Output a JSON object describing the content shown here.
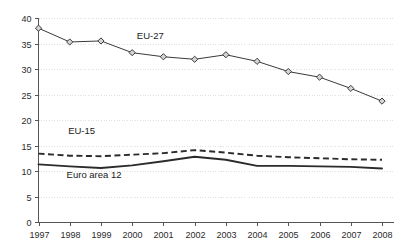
{
  "chart_data": {
    "type": "line",
    "title": "",
    "subtitle": "",
    "xlabel": "",
    "ylabel": "",
    "x": [
      1997,
      1998,
      1999,
      2000,
      2001,
      2002,
      2003,
      2004,
      2005,
      2006,
      2007,
      2008
    ],
    "categories": [
      "1997",
      "1998",
      "1999",
      "2000",
      "2001",
      "2002",
      "2003",
      "2004",
      "2005",
      "2006",
      "2007",
      "2008"
    ],
    "xlim": [
      1997,
      2008
    ],
    "ylim": [
      0,
      40
    ],
    "y_ticks": [
      0,
      5,
      10,
      15,
      20,
      25,
      30,
      35,
      40
    ],
    "y_tick_labels": [
      "0",
      "5",
      "10",
      "15",
      "20",
      "25",
      "30",
      "35",
      "40"
    ],
    "grid": true,
    "grid_axis": "y",
    "legend": "inline-annotations",
    "series": [
      {
        "name": "EU-27",
        "style": "solid-with-diamond-markers",
        "values": [
          38.0,
          35.3,
          35.5,
          33.2,
          32.4,
          31.9,
          32.8,
          31.5,
          29.5,
          28.4,
          26.2,
          23.7
        ]
      },
      {
        "name": "EU-15",
        "style": "dashed",
        "values": [
          13.4,
          13.0,
          12.9,
          13.2,
          13.5,
          14.1,
          13.6,
          13.0,
          12.7,
          12.5,
          12.3,
          12.2
        ]
      },
      {
        "name": "Euro area 12",
        "style": "solid-thick",
        "values": [
          11.3,
          10.9,
          10.6,
          11.1,
          11.9,
          12.8,
          12.2,
          11.0,
          11.0,
          10.9,
          10.8,
          10.5
        ]
      }
    ],
    "annotations": [
      {
        "text": "EU-27",
        "x": 2000.15,
        "y": 35.8
      },
      {
        "text": "EU-15",
        "x": 1997.95,
        "y": 17.2
      },
      {
        "text": "Euro area 12",
        "x": 1997.9,
        "y": 8.7
      }
    ]
  },
  "colors": {
    "background": "#ffffff",
    "axis": "#555555",
    "grid": "#d8d8d8",
    "line": "#2b2b2b",
    "marker_fill": "#d5d5d5",
    "text": "#2b2b2b"
  }
}
